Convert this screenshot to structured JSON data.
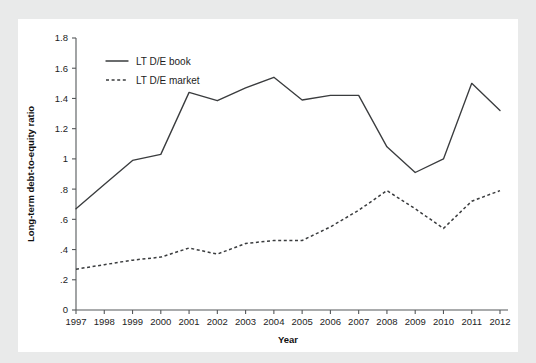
{
  "chart_data": {
    "type": "line",
    "title": "",
    "xlabel": "Year",
    "ylabel": "Long-term debt-to-equity ratio",
    "categories": [
      1997,
      1998,
      1999,
      2000,
      2001,
      2002,
      2003,
      2004,
      2005,
      2006,
      2007,
      2008,
      2009,
      2010,
      2011,
      2012
    ],
    "x_tick_labels": [
      "1997",
      "1998",
      "1999",
      "2000",
      "2001",
      "2002",
      "2003",
      "2004",
      "2005",
      "2006",
      "2007",
      "2008",
      "2009",
      "2010",
      "2011",
      "2012"
    ],
    "y_tick_labels": [
      "0",
      ".2",
      ".4",
      ".6",
      ".8",
      "1",
      "1.2",
      "1.4",
      "1.6",
      "1.8"
    ],
    "y_tick_values": [
      0,
      0.2,
      0.4,
      0.6,
      0.8,
      1.0,
      1.2,
      1.4,
      1.6,
      1.8
    ],
    "ylim": [
      0,
      1.8
    ],
    "xlim": [
      1997,
      2012
    ],
    "grid": false,
    "legend_position": "top-left-inside",
    "series": [
      {
        "name": "LT D/E book",
        "style": "solid",
        "color": "#3a3c3e",
        "values": [
          0.67,
          0.83,
          0.99,
          1.03,
          1.44,
          1.385,
          1.47,
          1.54,
          1.39,
          1.42,
          1.42,
          1.08,
          0.91,
          1.0,
          1.5,
          1.32
        ]
      },
      {
        "name": "LT D/E market",
        "style": "dashed",
        "color": "#3a3c3e",
        "values": [
          0.27,
          0.3,
          0.33,
          0.35,
          0.41,
          0.37,
          0.44,
          0.46,
          0.46,
          0.55,
          0.66,
          0.79,
          0.67,
          0.54,
          0.72,
          0.79
        ]
      }
    ]
  },
  "legend": {
    "items": [
      {
        "label": "LT D/E book",
        "style": "solid"
      },
      {
        "label": "LT D/E market",
        "style": "dashed"
      }
    ]
  },
  "colors": {
    "page_background": "#e9eaea",
    "panel_background": "#ffffff",
    "axis": "#55585a",
    "line": "#3a3c3e",
    "text": "#1d1d1d"
  }
}
